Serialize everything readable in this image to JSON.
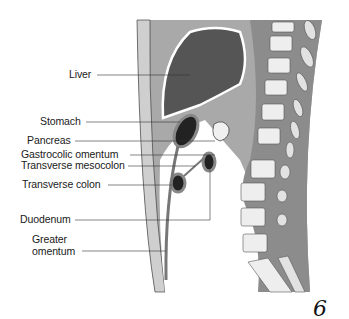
{
  "figure": {
    "number": "6",
    "colors": {
      "wall": "#b5b5b5",
      "wall_light": "#d9d9d9",
      "organ_dark": "#4a4a4a",
      "spine_bg": "#8e8e8e",
      "vertebra": "#ececec",
      "line": "#333333"
    }
  },
  "labels": [
    {
      "id": "liver",
      "text": "Liver"
    },
    {
      "id": "stomach",
      "text": "Stomach"
    },
    {
      "id": "pancreas",
      "text": "Pancreas"
    },
    {
      "id": "gastrocolic-omentum",
      "text": "Gastrocolic omentum"
    },
    {
      "id": "transverse-mesocolon",
      "text": "Transverse mesocolon"
    },
    {
      "id": "transverse-colon",
      "text": "Transverse colon"
    },
    {
      "id": "duodenum",
      "text": "Duodenum"
    },
    {
      "id": "greater-omentum-1",
      "text": "Greater"
    },
    {
      "id": "greater-omentum-2",
      "text": "omentum"
    }
  ]
}
